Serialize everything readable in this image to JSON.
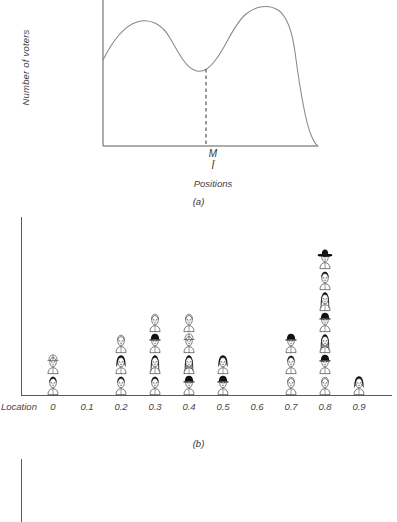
{
  "figure": {
    "panel_labels": [
      "(a)",
      "(b)",
      "(c)"
    ]
  },
  "panel_a": {
    "ylabel": "Number of voters",
    "xlabel": "Positions",
    "median_label": "M",
    "median_sub_label": "Ī"
  },
  "panel_b": {
    "axis_prefix": "Location",
    "tick_labels": [
      "0",
      "0.1",
      "0.2",
      "0.3",
      "0.4",
      "0.5",
      "0.6",
      "0.7",
      "0.8",
      "0.9"
    ]
  },
  "colors": {
    "axis": "#5a5a5a",
    "curve": "#777777",
    "text": "#3b3b3b",
    "ink": "#111111"
  },
  "chart_data": [
    {
      "type": "line",
      "title": "(a)",
      "xlabel": "Positions",
      "ylabel": "Number of voters",
      "grid": false,
      "legend": null,
      "xlim": [
        0,
        1
      ],
      "ylim": [
        0,
        1
      ],
      "annotations": [
        {
          "text": "M",
          "x": 0.46,
          "note": "dashed vertical line at local minimum between the two modes"
        },
        {
          "text": "Ī",
          "x": 0.46,
          "note": "mean position marker, drawn directly beneath M"
        }
      ],
      "series": [
        {
          "name": "voter density",
          "x": [
            0.0,
            0.05,
            0.1,
            0.15,
            0.2,
            0.25,
            0.3,
            0.35,
            0.4,
            0.46,
            0.52,
            0.58,
            0.64,
            0.7,
            0.76,
            0.82,
            0.88,
            0.94,
            1.0
          ],
          "y": [
            0.58,
            0.7,
            0.79,
            0.85,
            0.87,
            0.87,
            0.85,
            0.79,
            0.7,
            0.62,
            0.64,
            0.74,
            0.87,
            0.95,
            0.98,
            0.96,
            0.82,
            0.45,
            0.02
          ]
        }
      ]
    },
    {
      "type": "bar",
      "title": "(b)",
      "xlabel": "Location",
      "ylabel": "",
      "grid": false,
      "legend": null,
      "unit": "one face icon = one voter",
      "categories": [
        "0",
        "0.1",
        "0.2",
        "0.3",
        "0.4",
        "0.5",
        "0.6",
        "0.7",
        "0.8",
        "0.9"
      ],
      "values": [
        2,
        0,
        3,
        4,
        4,
        2,
        0,
        3,
        7,
        1
      ]
    },
    {
      "type": "bar",
      "title": "(c)",
      "xlabel": "",
      "ylabel": "",
      "grid": false,
      "legend": null,
      "unit": "one face icon = one voter",
      "note": "panel is cropped by the bottom edge of the screenshot; only partial columns are visible",
      "categories": [
        "0",
        "0.1",
        "0.2",
        "0.3",
        "0.4",
        "0.5",
        "0.6",
        "0.7",
        "0.8",
        "0.9"
      ],
      "values": [
        0,
        0,
        0,
        1,
        0,
        0,
        0,
        1,
        3,
        0
      ]
    }
  ],
  "faces": {
    "panel_b": [
      [
        "short-dark-hair",
        "helmet-hat"
      ],
      [],
      [
        "short-dark-hair",
        "bob-dark-hair",
        "short-light-hair"
      ],
      [
        "short-dark-hair",
        "long-hair",
        "cap-hat",
        "short-light-hair"
      ],
      [
        "cap-hat",
        "long-hair-hands",
        "helmet-hat",
        "short-light-hair"
      ],
      [
        "cap-hat",
        "bob-dark-hair"
      ],
      [],
      [
        "short-light-hair",
        "short-dark-hair",
        "cap-hat"
      ],
      [
        "short-light-hair",
        "cap-hat",
        "long-hair-hands",
        "cap-hat",
        "long-hair",
        "short-dark-hair",
        "cowboy-hat"
      ],
      [
        "bob-dark-hair"
      ]
    ],
    "panel_c": [
      [],
      [],
      [],
      [
        "short-light-hair"
      ],
      [],
      [],
      [],
      [
        "short-light-hair"
      ],
      [
        "helmet-hat",
        "long-hair",
        "short-dark-hair"
      ],
      []
    ]
  }
}
